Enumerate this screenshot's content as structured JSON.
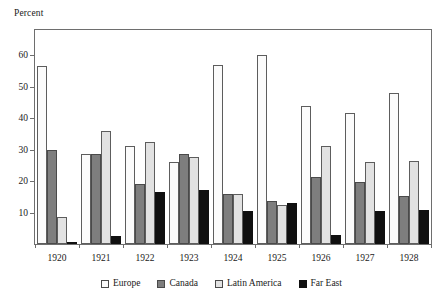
{
  "chart_data": {
    "type": "bar",
    "title": "",
    "xlabel": "",
    "ylabel": "Percent",
    "ylim": [
      0,
      68
    ],
    "yticks": [
      10,
      20,
      30,
      40,
      50,
      60
    ],
    "grid": false,
    "legend_position": "bottom",
    "categories": [
      "1920",
      "1921",
      "1922",
      "1923",
      "1924",
      "1925",
      "1926",
      "1927",
      "1928"
    ],
    "series": [
      {
        "name": "Europe",
        "color": "#fbfbfb",
        "values": [
          56.5,
          28.5,
          31.3,
          26.0,
          57.0,
          60.0,
          43.8,
          41.7,
          48.0
        ]
      },
      {
        "name": "Canada",
        "color": "#7e7e7e",
        "values": [
          29.8,
          28.7,
          19.0,
          28.5,
          15.8,
          13.8,
          21.3,
          19.6,
          15.2
        ]
      },
      {
        "name": "Latin America",
        "color": "#e2e2e2",
        "values": [
          8.5,
          35.8,
          32.5,
          27.5,
          16.0,
          12.3,
          31.3,
          26.2,
          26.5
        ]
      },
      {
        "name": "Far East",
        "color": "#101010",
        "values": [
          0.3,
          2.5,
          16.5,
          17.2,
          10.5,
          13.0,
          3.0,
          10.6,
          10.7
        ]
      }
    ]
  },
  "axis_caption": "Percent",
  "legend": {
    "items": [
      {
        "label": "Europe"
      },
      {
        "label": "Canada"
      },
      {
        "label": "Latin America"
      },
      {
        "label": "Far East"
      }
    ]
  }
}
